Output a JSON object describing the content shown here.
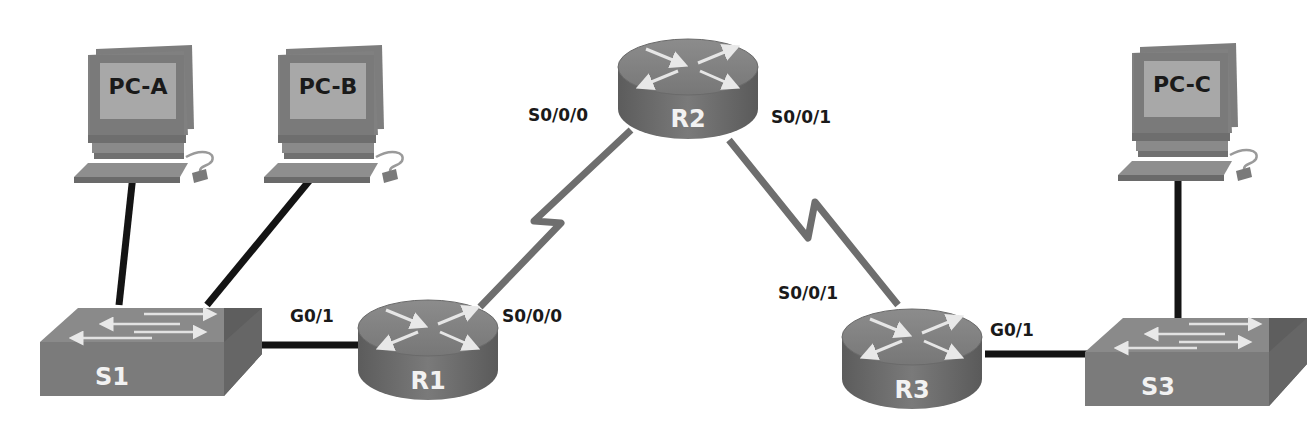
{
  "colors": {
    "background": "#ffffff",
    "ethernet_link": "#141414",
    "serial_link": "#6e6e6e",
    "device_top": "#8a8a8a",
    "device_side": "#6c6c6c",
    "pc_screen": "#a6a6a6",
    "pc_frame": "#7b7b7b",
    "label_text": "#1a1a1a",
    "device_label_text": "#f2f2f2"
  },
  "devices": {
    "pc_a": {
      "label": "PC-A",
      "type": "pc"
    },
    "pc_b": {
      "label": "PC-B",
      "type": "pc"
    },
    "pc_c": {
      "label": "PC-C",
      "type": "pc"
    },
    "s1": {
      "label": "S1",
      "type": "switch"
    },
    "s3": {
      "label": "S3",
      "type": "switch"
    },
    "r1": {
      "label": "R1",
      "type": "router"
    },
    "r2": {
      "label": "R2",
      "type": "router"
    },
    "r3": {
      "label": "R3",
      "type": "router"
    }
  },
  "interfaces": {
    "r1_g01": "G0/1",
    "r1_s000": "S0/0/0",
    "r2_s000": "S0/0/0",
    "r2_s001": "S0/0/1",
    "r3_s001": "S0/0/1",
    "r3_g01": "G0/1"
  },
  "links": [
    {
      "from": "PC-A",
      "to": "S1",
      "type": "ethernet"
    },
    {
      "from": "PC-B",
      "to": "S1",
      "type": "ethernet"
    },
    {
      "from": "S1",
      "to": "R1",
      "to_iface": "G0/1",
      "type": "ethernet"
    },
    {
      "from": "R1",
      "from_iface": "S0/0/0",
      "to": "R2",
      "to_iface": "S0/0/0",
      "type": "serial"
    },
    {
      "from": "R2",
      "from_iface": "S0/0/1",
      "to": "R3",
      "to_iface": "S0/0/1",
      "type": "serial"
    },
    {
      "from": "R3",
      "from_iface": "G0/1",
      "to": "S3",
      "type": "ethernet"
    },
    {
      "from": "S3",
      "to": "PC-C",
      "type": "ethernet"
    }
  ]
}
